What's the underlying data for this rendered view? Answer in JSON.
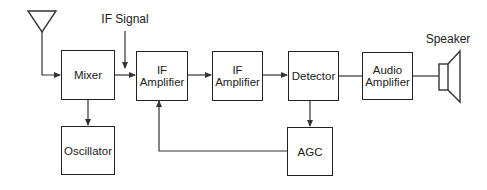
{
  "diagram": {
    "labels": {
      "if_signal": "IF Signal",
      "speaker": "Speaker"
    },
    "blocks": {
      "mixer": {
        "line1": "Mixer"
      },
      "oscillator": {
        "line1": "Oscillator"
      },
      "if_amp_1": {
        "line1": "IF",
        "line2": "Amplifier"
      },
      "if_amp_2": {
        "line1": "IF",
        "line2": "Amplifier"
      },
      "detector": {
        "line1": "Detector"
      },
      "audio_amp": {
        "line1": "Audio",
        "line2": "Amplifier"
      },
      "agc": {
        "line1": "AGC"
      }
    },
    "connections": [
      {
        "from": "antenna",
        "to": "mixer"
      },
      {
        "from": "mixer",
        "to": "if_amp_1"
      },
      {
        "from": "if_signal",
        "to": "mixer-if_amp_1 link"
      },
      {
        "from": "mixer",
        "to": "oscillator"
      },
      {
        "from": "if_amp_1",
        "to": "if_amp_2"
      },
      {
        "from": "if_amp_2",
        "to": "detector"
      },
      {
        "from": "detector",
        "to": "audio_amp"
      },
      {
        "from": "audio_amp",
        "to": "speaker"
      },
      {
        "from": "detector",
        "to": "agc"
      },
      {
        "from": "agc",
        "to": "if_amp_1"
      }
    ],
    "colors": {
      "line": "#222222",
      "background": "#ffffff"
    }
  }
}
